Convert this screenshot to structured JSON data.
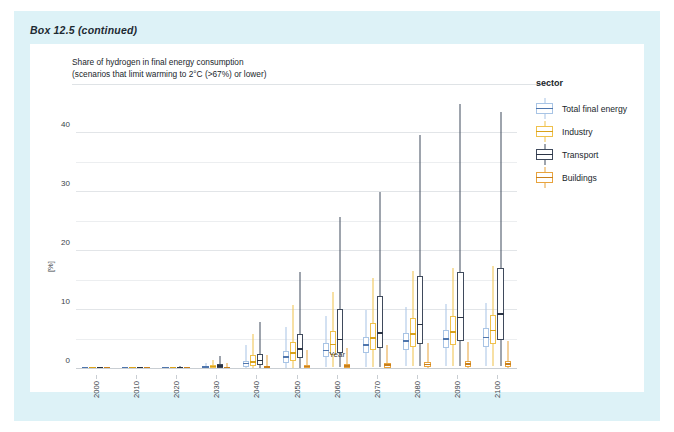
{
  "box_label": "Box 12.5 (continued)",
  "figure": {
    "subtitle": "Share of hydrogen in final energy consumption\n(scenarios that limit warming to 2°C (>67%) or lower)"
  },
  "legend": {
    "title": "sector",
    "items": [
      {
        "label": "Total final energy",
        "color": "#a8c4e5",
        "median_color": "#4f76ad"
      },
      {
        "label": "Industry",
        "color": "#f0c14b",
        "median_color": "#d9a21b"
      },
      {
        "label": "Transport",
        "color": "#3f4a5c",
        "median_color": "#2b3445"
      },
      {
        "label": "Buildings",
        "color": "#e8a33d",
        "median_color": "#c9801c"
      }
    ]
  },
  "chart_data": {
    "type": "boxplot",
    "title": "Share of hydrogen in final energy consumption",
    "subtitle": "(scenarios that limit warming to 2°C (>67%) or lower)",
    "xlabel": "Year",
    "ylabel": "[%]",
    "ylim": [
      0,
      45
    ],
    "yticks": [
      0,
      10,
      20,
      30,
      40
    ],
    "yminor": [
      5,
      15,
      25,
      35
    ],
    "grid": true,
    "legend_position": "right",
    "categories": [
      "2000",
      "2010",
      "2020",
      "2030",
      "2040",
      "2050",
      "2060",
      "2070",
      "2080",
      "2090",
      "2100"
    ],
    "series": [
      {
        "name": "Total final energy",
        "color": "#a8c4e5",
        "median_color": "#4f76ad",
        "stats": [
          {
            "year": "2000",
            "min": 0.0,
            "q1": 0.0,
            "med": 0.0,
            "q3": 0.0,
            "max": 0.1
          },
          {
            "year": "2010",
            "min": 0.0,
            "q1": 0.0,
            "med": 0.0,
            "q3": 0.0,
            "max": 0.1
          },
          {
            "year": "2020",
            "min": 0.0,
            "q1": 0.0,
            "med": 0.0,
            "q3": 0.1,
            "max": 0.2
          },
          {
            "year": "2030",
            "min": 0.0,
            "q1": 0.1,
            "med": 0.2,
            "q3": 0.4,
            "max": 1.1
          },
          {
            "year": "2040",
            "min": 0.1,
            "q1": 0.4,
            "med": 0.8,
            "q3": 1.4,
            "max": 4.0
          },
          {
            "year": "2050",
            "min": 0.2,
            "q1": 1.1,
            "med": 1.9,
            "q3": 3.0,
            "max": 7.2
          },
          {
            "year": "2060",
            "min": 0.3,
            "q1": 2.0,
            "med": 3.0,
            "q3": 4.4,
            "max": 9.0
          },
          {
            "year": "2070",
            "min": 0.4,
            "q1": 2.7,
            "med": 3.9,
            "q3": 5.4,
            "max": 10.0
          },
          {
            "year": "2080",
            "min": 0.5,
            "q1": 3.2,
            "med": 4.6,
            "q3": 6.2,
            "max": 10.6
          },
          {
            "year": "2090",
            "min": 0.5,
            "q1": 3.5,
            "med": 5.0,
            "q3": 6.7,
            "max": 11.0
          },
          {
            "year": "2100",
            "min": 0.5,
            "q1": 3.7,
            "med": 5.2,
            "q3": 7.0,
            "max": 11.2
          }
        ]
      },
      {
        "name": "Industry",
        "color": "#f0c14b",
        "median_color": "#d9a21b",
        "stats": [
          {
            "year": "2000",
            "min": 0.0,
            "q1": 0.0,
            "med": 0.0,
            "q3": 0.0,
            "max": 0.1
          },
          {
            "year": "2010",
            "min": 0.0,
            "q1": 0.0,
            "med": 0.0,
            "q3": 0.0,
            "max": 0.1
          },
          {
            "year": "2020",
            "min": 0.0,
            "q1": 0.0,
            "med": 0.1,
            "q3": 0.2,
            "max": 0.4
          },
          {
            "year": "2030",
            "min": 0.0,
            "q1": 0.1,
            "med": 0.3,
            "q3": 0.6,
            "max": 1.6
          },
          {
            "year": "2040",
            "min": 0.1,
            "q1": 0.5,
            "med": 1.1,
            "q3": 2.3,
            "max": 6.0
          },
          {
            "year": "2050",
            "min": 0.2,
            "q1": 1.4,
            "med": 2.6,
            "q3": 4.6,
            "max": 10.8
          },
          {
            "year": "2060",
            "min": 0.3,
            "q1": 2.4,
            "med": 4.0,
            "q3": 6.4,
            "max": 13.0
          },
          {
            "year": "2070",
            "min": 0.4,
            "q1": 3.2,
            "med": 5.1,
            "q3": 7.8,
            "max": 15.4
          },
          {
            "year": "2080",
            "min": 0.5,
            "q1": 3.8,
            "med": 5.8,
            "q3": 8.6,
            "max": 16.6
          },
          {
            "year": "2090",
            "min": 0.5,
            "q1": 4.1,
            "med": 6.2,
            "q3": 9.0,
            "max": 17.2
          },
          {
            "year": "2100",
            "min": 0.5,
            "q1": 4.3,
            "med": 6.4,
            "q3": 9.2,
            "max": 17.5
          }
        ]
      },
      {
        "name": "Transport",
        "color": "#3f4a5c",
        "median_color": "#2b3445",
        "stats": [
          {
            "year": "2000",
            "min": 0.0,
            "q1": 0.0,
            "med": 0.0,
            "q3": 0.0,
            "max": 0.1
          },
          {
            "year": "2010",
            "min": 0.0,
            "q1": 0.0,
            "med": 0.0,
            "q3": 0.0,
            "max": 0.1
          },
          {
            "year": "2020",
            "min": 0.0,
            "q1": 0.0,
            "med": 0.1,
            "q3": 0.2,
            "max": 0.5
          },
          {
            "year": "2030",
            "min": 0.0,
            "q1": 0.2,
            "med": 0.4,
            "q3": 0.9,
            "max": 2.2
          },
          {
            "year": "2040",
            "min": 0.1,
            "q1": 0.6,
            "med": 1.3,
            "q3": 2.6,
            "max": 8.0
          },
          {
            "year": "2050",
            "min": 0.2,
            "q1": 1.8,
            "med": 3.3,
            "q3": 6.0,
            "max": 16.4
          },
          {
            "year": "2060",
            "min": 0.3,
            "q1": 2.8,
            "med": 4.9,
            "q3": 10.2,
            "max": 25.8
          },
          {
            "year": "2070",
            "min": 0.4,
            "q1": 3.6,
            "med": 6.0,
            "q3": 12.4,
            "max": 30.0
          },
          {
            "year": "2080",
            "min": 0.5,
            "q1": 4.2,
            "med": 7.4,
            "q3": 15.8,
            "max": 39.8
          },
          {
            "year": "2090",
            "min": 0.5,
            "q1": 4.8,
            "med": 8.6,
            "q3": 16.4,
            "max": 45.0
          },
          {
            "year": "2100",
            "min": 0.5,
            "q1": 5.0,
            "med": 9.2,
            "q3": 17.2,
            "max": 43.6
          }
        ]
      },
      {
        "name": "Buildings",
        "color": "#e8a33d",
        "median_color": "#c9801c",
        "stats": [
          {
            "year": "2000",
            "min": 0.0,
            "q1": 0.0,
            "med": 0.0,
            "q3": 0.0,
            "max": 0.1
          },
          {
            "year": "2010",
            "min": 0.0,
            "q1": 0.0,
            "med": 0.0,
            "q3": 0.0,
            "max": 0.1
          },
          {
            "year": "2020",
            "min": 0.0,
            "q1": 0.0,
            "med": 0.0,
            "q3": 0.1,
            "max": 0.3
          },
          {
            "year": "2030",
            "min": 0.0,
            "q1": 0.0,
            "med": 0.1,
            "q3": 0.2,
            "max": 1.0
          },
          {
            "year": "2040",
            "min": 0.0,
            "q1": 0.1,
            "med": 0.2,
            "q3": 0.4,
            "max": 2.4
          },
          {
            "year": "2050",
            "min": 0.0,
            "q1": 0.1,
            "med": 0.3,
            "q3": 0.6,
            "max": 3.2
          },
          {
            "year": "2060",
            "min": 0.0,
            "q1": 0.2,
            "med": 0.4,
            "q3": 0.8,
            "max": 3.6
          },
          {
            "year": "2070",
            "min": 0.0,
            "q1": 0.2,
            "med": 0.5,
            "q3": 1.0,
            "max": 4.0
          },
          {
            "year": "2080",
            "min": 0.0,
            "q1": 0.3,
            "med": 0.6,
            "q3": 1.2,
            "max": 4.4
          },
          {
            "year": "2090",
            "min": 0.0,
            "q1": 0.3,
            "med": 0.7,
            "q3": 1.4,
            "max": 4.6
          },
          {
            "year": "2100",
            "min": 0.0,
            "q1": 0.3,
            "med": 0.7,
            "q3": 1.4,
            "max": 4.8
          }
        ]
      }
    ]
  }
}
